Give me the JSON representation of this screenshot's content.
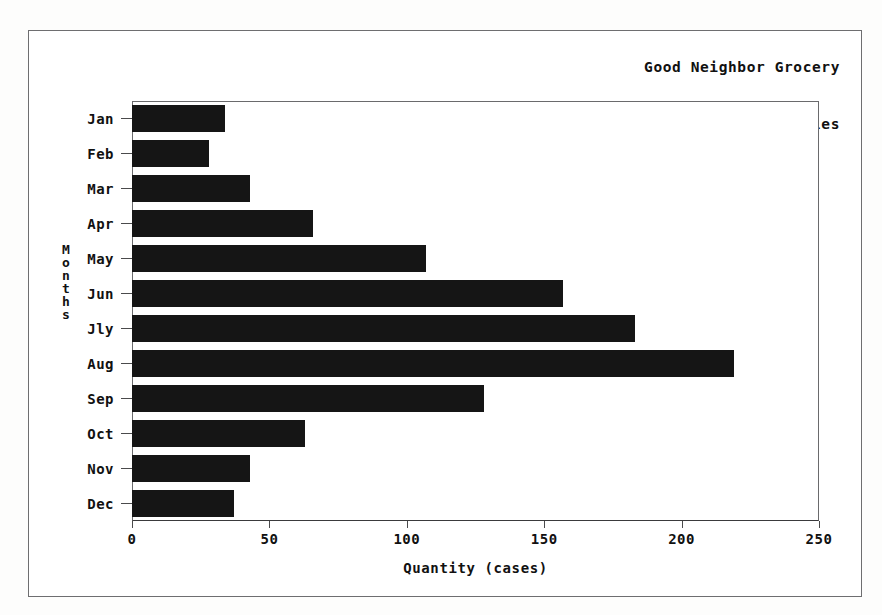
{
  "page": {
    "background_color": "#fdfdfc",
    "frame_color": "#6e6e70"
  },
  "chart_data": {
    "type": "bar",
    "orientation": "horizontal",
    "title": "Good Neighbor Grocery Orange Juice Sales",
    "title_lines": [
      "Good Neighbor Grocery",
      "Orange Juice Sales"
    ],
    "title_position": "top-right",
    "xlabel": "Quantity (cases)",
    "ylabel": "Months",
    "categories": [
      "Jan",
      "Feb",
      "Mar",
      "Apr",
      "May",
      "Jun",
      "Jly",
      "Aug",
      "Sep",
      "Oct",
      "Nov",
      "Dec"
    ],
    "values": [
      34,
      28,
      43,
      66,
      107,
      157,
      183,
      219,
      128,
      63,
      43,
      37
    ],
    "xlim": [
      0,
      250
    ],
    "ylim": null,
    "xticks": [
      0,
      50,
      100,
      150,
      200,
      250
    ],
    "xtick_labels": [
      "0",
      "50",
      "100",
      "150",
      "200",
      "250"
    ],
    "grid": false,
    "legend": null,
    "bar_color": "#151515",
    "plot_background": "#ffffff",
    "series": [
      {
        "name": "Orange Juice Sales",
        "values": [
          34,
          28,
          43,
          66,
          107,
          157,
          183,
          219,
          128,
          63,
          43,
          37
        ]
      }
    ]
  }
}
